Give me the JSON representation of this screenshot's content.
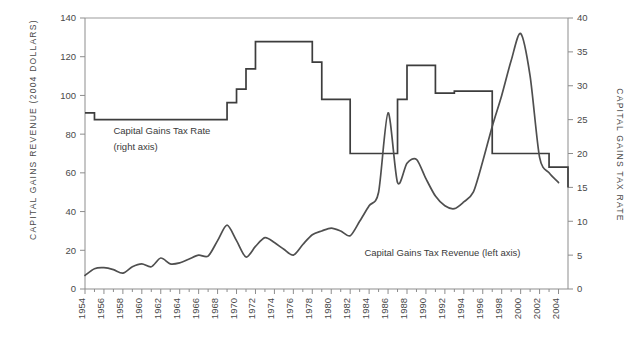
{
  "chart_data": {
    "type": "line",
    "title": "",
    "xlabel": "",
    "ylabel": "CAPITAL GAINS REVENUE (2004 DOLLARS)",
    "y2label": "CAPITAL GAINS TAX RATE",
    "xlim": [
      1954,
      2005
    ],
    "ylim": [
      0,
      140
    ],
    "y2lim": [
      0,
      40
    ],
    "grid": false,
    "legend_position": "inline-annotations",
    "yticks": [
      0,
      20,
      40,
      60,
      80,
      100,
      120,
      140
    ],
    "y2ticks": [
      0,
      5,
      10,
      15,
      20,
      25,
      30,
      35,
      40
    ],
    "xticks": [
      1954,
      1956,
      1958,
      1960,
      1962,
      1964,
      1966,
      1968,
      1970,
      1972,
      1974,
      1976,
      1978,
      1980,
      1982,
      1984,
      1986,
      1988,
      1990,
      1992,
      1994,
      1996,
      1998,
      2000,
      2002,
      2004
    ],
    "xtick_labels": [
      "1954",
      "1956",
      "1958",
      "1960",
      "1962",
      "1964",
      "1966",
      "1968",
      "1970",
      "1972",
      "1974",
      "1976",
      "1978",
      "1980",
      "1982",
      "1984",
      "1986",
      "1988",
      "1990",
      "1992",
      "1994",
      "1996",
      "1998",
      "2000",
      "2002",
      "2004"
    ],
    "annotations": [
      {
        "text": "Capital Gains Tax Rate",
        "x": 1957,
        "y": 80
      },
      {
        "text": "(right axis)",
        "x": 1957,
        "y": 72
      },
      {
        "text": "Capital Gains Tax Revenue (left axis)",
        "x": 1983.5,
        "y": 17
      }
    ],
    "series": [
      {
        "name": "Capital Gains Tax Revenue (left axis)",
        "axis": "left",
        "units": "billions of 2004 dollars",
        "color": "#4f4f4f",
        "x": [
          1954,
          1955,
          1956,
          1957,
          1958,
          1959,
          1960,
          1961,
          1962,
          1963,
          1964,
          1965,
          1966,
          1967,
          1968,
          1969,
          1970,
          1971,
          1972,
          1973,
          1974,
          1975,
          1976,
          1977,
          1978,
          1979,
          1980,
          1981,
          1982,
          1983,
          1984,
          1985,
          1986,
          1987,
          1988,
          1989,
          1990,
          1991,
          1992,
          1993,
          1994,
          1995,
          1996,
          1997,
          1998,
          1999,
          2000,
          2001,
          2002,
          2003,
          2004
        ],
        "values": [
          7,
          10.5,
          11,
          10,
          8.2,
          11.5,
          13,
          11.5,
          16,
          13,
          13.5,
          15.5,
          17.5,
          17,
          25,
          33,
          25,
          16.5,
          22,
          26.5,
          24,
          20.5,
          17.5,
          23,
          28,
          30,
          31.5,
          30,
          27.5,
          35,
          43,
          50,
          91,
          55,
          65,
          67,
          57,
          48,
          43,
          41.5,
          45,
          50,
          66,
          84,
          100,
          118,
          132,
          110,
          68,
          60,
          55
        ]
      },
      {
        "name": "Capital Gains Tax Rate (right axis)",
        "axis": "right",
        "units": "percent",
        "color": "#3d3d3d",
        "step": true,
        "x": [
          1954,
          1955,
          1968,
          1969,
          1970,
          1971,
          1972,
          1976,
          1978,
          1979,
          1981,
          1982,
          1987,
          1988,
          1991,
          1993,
          1997,
          2003,
          2005
        ],
        "values": [
          26,
          25,
          25,
          27.5,
          29.5,
          32.5,
          36.5,
          36.5,
          33.5,
          28,
          28,
          20,
          28,
          33,
          28.9,
          29.2,
          20,
          18,
          15
        ]
      }
    ]
  }
}
